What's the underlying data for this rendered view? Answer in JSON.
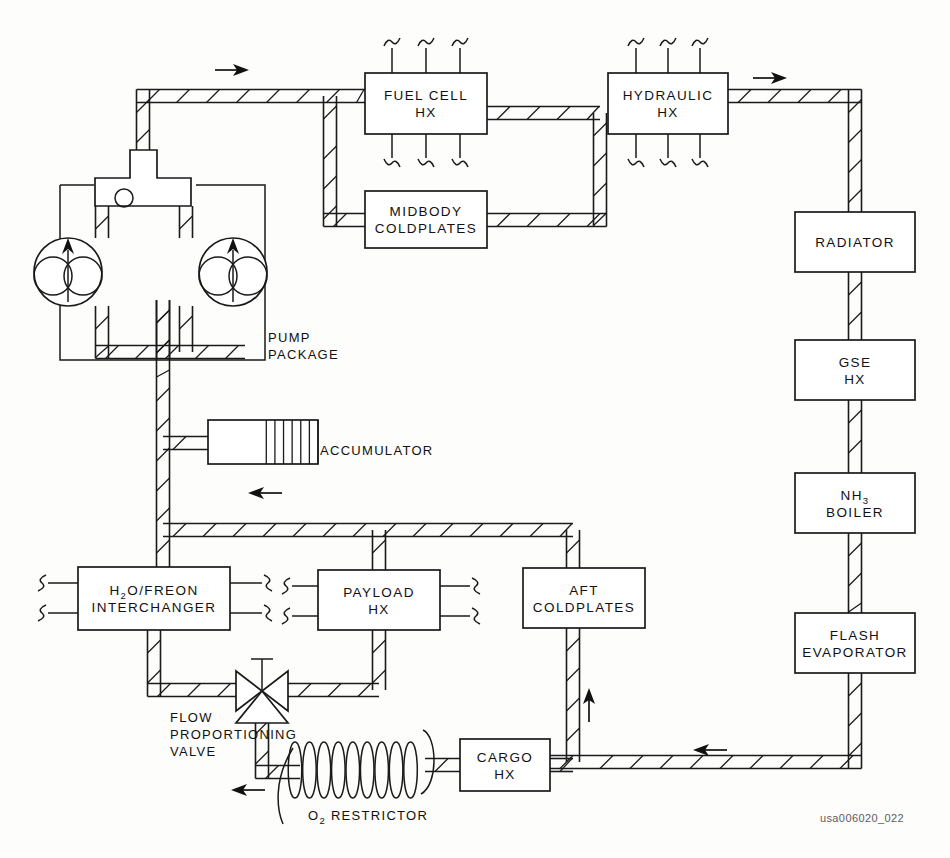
{
  "diagram": {
    "caption": "usa006020_022",
    "line_color": "#1a1a1a",
    "background": "#fdfdfc"
  },
  "components": [
    {
      "id": "fuel-cell-hx",
      "lines": [
        "FUEL CELL",
        "HX"
      ],
      "x": 365,
      "y": 73,
      "w": 122,
      "h": 61,
      "stub_top": 3,
      "stub_bottom": 3
    },
    {
      "id": "hydraulic-hx",
      "lines": [
        "HYDRAULIC",
        "HX"
      ],
      "x": 608,
      "y": 73,
      "w": 120,
      "h": 61,
      "stub_top": 3,
      "stub_bottom": 3
    },
    {
      "id": "midbody-coldplates",
      "lines": [
        "MIDBODY",
        "COLDPLATES"
      ],
      "x": 365,
      "y": 191,
      "w": 122,
      "h": 57,
      "stub_top": 0,
      "stub_bottom": 0
    },
    {
      "id": "radiator",
      "lines": [
        "RADIATOR"
      ],
      "x": 795,
      "y": 212,
      "w": 120,
      "h": 60,
      "stub_top": 0,
      "stub_bottom": 0
    },
    {
      "id": "gse-hx",
      "lines": [
        "GSE",
        "HX"
      ],
      "x": 795,
      "y": 340,
      "w": 120,
      "h": 60,
      "stub_top": 0,
      "stub_bottom": 0
    },
    {
      "id": "nh3-boiler",
      "lines": [
        "NH3",
        "BOILER"
      ],
      "x": 795,
      "y": 473,
      "w": 120,
      "h": 60,
      "stub_top": 0,
      "stub_bottom": 0,
      "subscript": "3"
    },
    {
      "id": "flash-evaporator",
      "lines": [
        "FLASH",
        "EVAPORATOR"
      ],
      "x": 795,
      "y": 613,
      "w": 120,
      "h": 60,
      "stub_top": 0,
      "stub_bottom": 0
    },
    {
      "id": "h2o-freon-interchanger",
      "lines": [
        "H2O/FREON",
        "INTERCHANGER"
      ],
      "x": 78,
      "y": 567,
      "w": 152,
      "h": 63,
      "subscript": "2"
    },
    {
      "id": "payload-hx",
      "lines": [
        "PAYLOAD",
        "HX"
      ],
      "x": 318,
      "y": 570,
      "w": 122,
      "h": 60
    },
    {
      "id": "aft-coldplates",
      "lines": [
        "AFT",
        "COLDPLATES"
      ],
      "x": 523,
      "y": 568,
      "w": 122,
      "h": 60
    },
    {
      "id": "cargo-hx",
      "lines": [
        "CARGO",
        "HX"
      ],
      "x": 460,
      "y": 739,
      "w": 90,
      "h": 52
    }
  ],
  "labels": [
    {
      "id": "pump-package-label",
      "lines": [
        "PUMP",
        "PACKAGE"
      ],
      "x": 268,
      "y": 342
    },
    {
      "id": "accumulator-label",
      "lines": [
        "ACCUMULATOR"
      ],
      "x": 320,
      "y": 455
    },
    {
      "id": "flow-proportioning-valve-label",
      "lines": [
        "FLOW",
        "PROPORTIONING",
        "VALVE"
      ],
      "x": 170,
      "y": 722
    },
    {
      "id": "o2-restrictor-label",
      "lines": [
        "O2 RESTRICTOR"
      ],
      "x": 308,
      "y": 820,
      "subscript": "2"
    }
  ],
  "flow_arrows": [
    {
      "id": "arrow-top-left",
      "x": 232,
      "y": 70,
      "dir": "right"
    },
    {
      "id": "arrow-top-right",
      "x": 770,
      "y": 78,
      "dir": "right"
    },
    {
      "id": "arrow-accumulator",
      "x": 265,
      "y": 493,
      "dir": "left"
    },
    {
      "id": "arrow-aft-riser",
      "x": 589,
      "y": 705,
      "dir": "up"
    },
    {
      "id": "arrow-bottom-right",
      "x": 710,
      "y": 750,
      "dir": "left"
    },
    {
      "id": "arrow-bottom-left",
      "x": 248,
      "y": 790,
      "dir": "left"
    }
  ],
  "pumps": [
    {
      "id": "pump-left",
      "cx": 68,
      "cy": 272,
      "r": 34
    },
    {
      "id": "pump-right",
      "cx": 233,
      "cy": 272,
      "r": 34
    }
  ],
  "accumulator": {
    "id": "accumulator",
    "x": 208,
    "y": 420,
    "w": 110,
    "h": 44,
    "bellows_start": 0.53,
    "bellows_count": 6
  },
  "valve": {
    "id": "flow-proportioning-valve",
    "cx": 262,
    "cy": 691,
    "hw": 26,
    "hh": 20
  },
  "restrictor": {
    "id": "o2-restrictor",
    "x": 295,
    "y": 742,
    "w": 130,
    "h": 56,
    "turns": 9
  },
  "pump_manifold": {
    "id": "pump-manifold",
    "x": 95,
    "y": 178,
    "w": 96,
    "h": 28,
    "indicator_cx": 124,
    "indicator_cy": 198,
    "indicator_r": 9
  }
}
